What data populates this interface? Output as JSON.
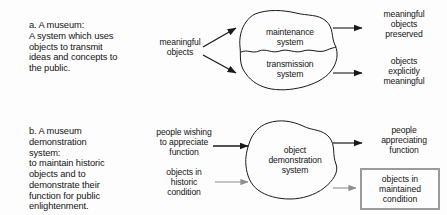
{
  "figure": {
    "background_color": "#fdfdfd",
    "stroke_color": "#1a1a1a",
    "muted_stroke_color": "#8e8e8e",
    "box_border_color": "#9a9a9a"
  },
  "sections": [
    {
      "key": "a",
      "description": "a. A museum:\nA system which uses\nobjects to transmit\nideas and concepts to\nthe public.",
      "inputs": [
        {
          "label": "meaningful\nobjects",
          "arrow_style": "solid-dark",
          "direction": "up-right"
        },
        {
          "label": "meaningful\nobjects",
          "arrow_style": "solid-dark",
          "direction": "down-right"
        }
      ],
      "system": {
        "shape": "blob",
        "divided": true,
        "parts": [
          {
            "label": "maintenance\nsystem"
          },
          {
            "label": "transmission\nsystem"
          }
        ]
      },
      "outputs": [
        {
          "label": "meaningful\nobjects\npreserved",
          "arrow_style": "solid-dark",
          "boxed": false
        },
        {
          "label": "objects\nexplicitly\nmeaningful",
          "arrow_style": "solid-dark",
          "boxed": false
        }
      ]
    },
    {
      "key": "b",
      "description": "b. A museum\ndemonstration\nsystem:\nto maintain historic\nobjects and to\ndemonstrate their\nfunction for public\nenlightenment.",
      "inputs": [
        {
          "label": "people wishing\nto appreciate\nfunction",
          "arrow_style": "solid-dark",
          "direction": "right"
        },
        {
          "label": "objects in\nhistoric\ncondition",
          "arrow_style": "solid-gray",
          "direction": "right"
        }
      ],
      "system": {
        "shape": "blob",
        "divided": false,
        "parts": [
          {
            "label": "object\ndemonstration\nsystem"
          }
        ]
      },
      "outputs": [
        {
          "label": "people\nappreciating\nfunction",
          "arrow_style": "solid-dark",
          "boxed": false
        },
        {
          "label": "objects in\nmaintained\ncondition",
          "arrow_style": "solid-gray",
          "boxed": true
        }
      ]
    }
  ]
}
